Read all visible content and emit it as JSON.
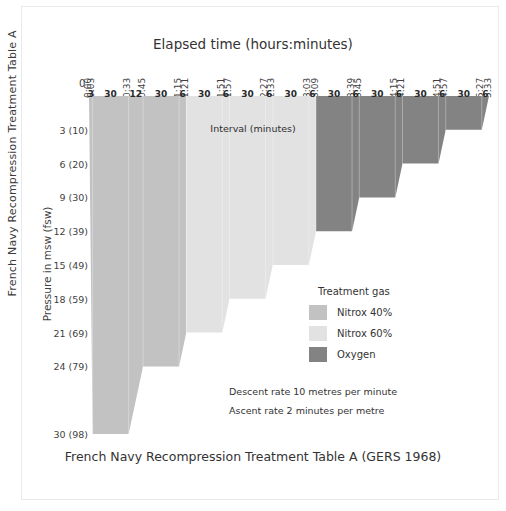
{
  "edge_caption": "French Navy Recompression Treatment Table A",
  "caption_bottom": "French Navy Recompression Treatment Table A (GERS 1968)",
  "interval_caption": "Interval (minutes)",
  "legend": {
    "title": "Treatment gas",
    "items": [
      {
        "label": "Nitrox 40%",
        "color": "#c2c2c2"
      },
      {
        "label": "Nitrox 60%",
        "color": "#e2e2e2"
      },
      {
        "label": "Oxygen",
        "color": "#838383"
      }
    ]
  },
  "notes": [
    "Descent rate 10 metres per minute",
    "Ascent rate 2 minutes per metre"
  ],
  "chart_data": {
    "type": "area",
    "title": "Elapsed time (hours:minutes)",
    "xlabel": "Elapsed time (hours:minutes)",
    "ylabel": "Pressure in msw (fsw)",
    "origin_label": "0",
    "grid": false,
    "legend_position": "inside-right",
    "xlim": [
      0,
      333
    ],
    "ylim": [
      0,
      30
    ],
    "y_ticks": [
      {
        "value": 3,
        "label": "3 (10)"
      },
      {
        "value": 6,
        "label": "6 (20)"
      },
      {
        "value": 9,
        "label": "9 (30)"
      },
      {
        "value": 12,
        "label": "12 (39)"
      },
      {
        "value": 15,
        "label": "15 (49)"
      },
      {
        "value": 18,
        "label": "18 (59)"
      },
      {
        "value": 21,
        "label": "21 (69)"
      },
      {
        "value": 24,
        "label": "24 (79)"
      },
      {
        "value": 30,
        "label": "30 (98)"
      }
    ],
    "x_ticks": [
      {
        "minutes": 0,
        "label": "0:00"
      },
      {
        "minutes": 3,
        "label": "0:03"
      },
      {
        "minutes": 33,
        "label": "0:33"
      },
      {
        "minutes": 45,
        "label": "0:45"
      },
      {
        "minutes": 75,
        "label": "1:15"
      },
      {
        "minutes": 81,
        "label": "1:21"
      },
      {
        "minutes": 111,
        "label": "1:51"
      },
      {
        "minutes": 117,
        "label": "1:57"
      },
      {
        "minutes": 147,
        "label": "2:27"
      },
      {
        "minutes": 153,
        "label": "2:33"
      },
      {
        "minutes": 183,
        "label": "3:03"
      },
      {
        "minutes": 189,
        "label": "3:09"
      },
      {
        "minutes": 219,
        "label": "3:39"
      },
      {
        "minutes": 225,
        "label": "3:45"
      },
      {
        "minutes": 255,
        "label": "4:15"
      },
      {
        "minutes": 261,
        "label": "4:21"
      },
      {
        "minutes": 291,
        "label": "4:51"
      },
      {
        "minutes": 297,
        "label": "4:57"
      },
      {
        "minutes": 327,
        "label": "5:27"
      },
      {
        "minutes": 333,
        "label": "5:33"
      }
    ],
    "interval_labels": [
      {
        "minutes": 3,
        "center": 1.5,
        "gas": "Nitrox 40%"
      },
      {
        "minutes": 30,
        "center": 18.0,
        "gas": "Nitrox 40%"
      },
      {
        "minutes": 12,
        "center": 39.0,
        "gas": "Nitrox 40%"
      },
      {
        "minutes": 30,
        "center": 60.0,
        "gas": "Nitrox 40%"
      },
      {
        "minutes": 6,
        "center": 78.0,
        "gas": "Nitrox 40%"
      },
      {
        "minutes": 30,
        "center": 96.0,
        "gas": "Nitrox 60%"
      },
      {
        "minutes": 6,
        "center": 114.0,
        "gas": "Nitrox 60%"
      },
      {
        "minutes": 30,
        "center": 132.0,
        "gas": "Nitrox 60%"
      },
      {
        "minutes": 6,
        "center": 150.0,
        "gas": "Nitrox 60%"
      },
      {
        "minutes": 30,
        "center": 168.0,
        "gas": "Nitrox 60%"
      },
      {
        "minutes": 6,
        "center": 186.0,
        "gas": "Nitrox 60%"
      },
      {
        "minutes": 30,
        "center": 204.0,
        "gas": "Oxygen"
      },
      {
        "minutes": 6,
        "center": 222.0,
        "gas": "Oxygen"
      },
      {
        "minutes": 30,
        "center": 240.0,
        "gas": "Oxygen"
      },
      {
        "minutes": 6,
        "center": 258.0,
        "gas": "Oxygen"
      },
      {
        "minutes": 30,
        "center": 276.0,
        "gas": "Oxygen"
      },
      {
        "minutes": 6,
        "center": 294.0,
        "gas": "Oxygen"
      },
      {
        "minutes": 30,
        "center": 312.0,
        "gas": "Oxygen"
      },
      {
        "minutes": 6,
        "center": 330.0,
        "gas": "Oxygen"
      }
    ],
    "profile": [
      {
        "minutes": 0,
        "depth": 0
      },
      {
        "minutes": 3,
        "depth": 30
      },
      {
        "minutes": 33,
        "depth": 30
      },
      {
        "minutes": 45,
        "depth": 24
      },
      {
        "minutes": 75,
        "depth": 24
      },
      {
        "minutes": 81,
        "depth": 21
      },
      {
        "minutes": 111,
        "depth": 21
      },
      {
        "minutes": 117,
        "depth": 18
      },
      {
        "minutes": 147,
        "depth": 18
      },
      {
        "minutes": 153,
        "depth": 15
      },
      {
        "minutes": 183,
        "depth": 15
      },
      {
        "minutes": 189,
        "depth": 12
      },
      {
        "minutes": 219,
        "depth": 12
      },
      {
        "minutes": 225,
        "depth": 9
      },
      {
        "minutes": 255,
        "depth": 9
      },
      {
        "minutes": 261,
        "depth": 6
      },
      {
        "minutes": 291,
        "depth": 6
      },
      {
        "minutes": 297,
        "depth": 3
      },
      {
        "minutes": 327,
        "depth": 3
      },
      {
        "minutes": 333,
        "depth": 0
      }
    ],
    "gas_segments": [
      {
        "gas": "Nitrox 40%",
        "color": "#c2c2c2",
        "from_minutes": 0,
        "to_minutes": 81
      },
      {
        "gas": "Nitrox 60%",
        "color": "#e2e2e2",
        "from_minutes": 81,
        "to_minutes": 189
      },
      {
        "gas": "Oxygen",
        "color": "#838383",
        "from_minutes": 189,
        "to_minutes": 333
      }
    ]
  }
}
